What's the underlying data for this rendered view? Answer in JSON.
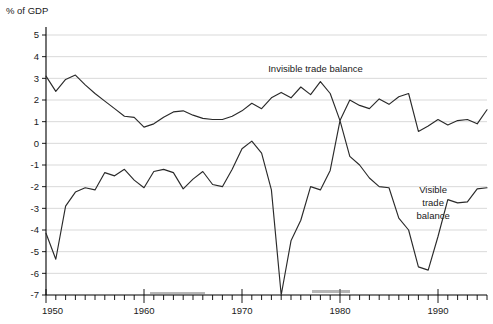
{
  "chart_data": {
    "type": "line",
    "title": "",
    "subtitle": "",
    "xlabel": "",
    "ylabel": "% of GDP",
    "ylim": [
      -7,
      5
    ],
    "xlim": [
      1950,
      1995
    ],
    "grid": true,
    "legend_position": "inline-annotations",
    "y_ticks": [
      "5",
      "4",
      "3",
      "2",
      "1",
      "0",
      "-1",
      "-2",
      "-3",
      "-4",
      "-5",
      "-6",
      "-7"
    ],
    "y_tick_values": [
      5,
      4,
      3,
      2,
      1,
      0,
      -1,
      -2,
      -3,
      -4,
      -5,
      -6,
      -7
    ],
    "x_ticks": [
      "1950",
      "1960",
      "1970",
      "1980",
      "1990"
    ],
    "x_tick_values": [
      1950,
      1960,
      1970,
      1980,
      1990
    ],
    "x_minor_interval": 1,
    "x": [
      1950,
      1951,
      1952,
      1953,
      1954,
      1955,
      1956,
      1957,
      1958,
      1959,
      1960,
      1961,
      1962,
      1963,
      1964,
      1965,
      1966,
      1967,
      1968,
      1969,
      1970,
      1971,
      1972,
      1973,
      1974,
      1975,
      1976,
      1977,
      1978,
      1979,
      1980,
      1981,
      1982,
      1983,
      1984,
      1985,
      1986,
      1987,
      1988,
      1989,
      1990,
      1991,
      1992,
      1993,
      1994,
      1995
    ],
    "series": [
      {
        "name": "Invisible trade balance",
        "color": "#2a2a2a",
        "values": [
          3.1,
          2.4,
          2.95,
          3.15,
          2.7,
          2.3,
          1.95,
          1.6,
          1.25,
          1.2,
          0.75,
          0.9,
          1.2,
          1.45,
          1.5,
          1.3,
          1.15,
          1.1,
          1.1,
          1.25,
          1.5,
          1.85,
          1.6,
          2.1,
          2.35,
          2.1,
          2.6,
          2.25,
          2.85,
          2.3,
          1.05,
          2.0,
          1.75,
          1.6,
          2.05,
          1.8,
          2.15,
          2.3,
          0.55,
          0.8,
          1.1,
          0.85,
          1.05,
          1.1,
          0.9,
          1.55
        ]
      },
      {
        "name": "Visible trade balance",
        "color": "#2a2a2a",
        "values": [
          -4.15,
          -5.35,
          -2.9,
          -2.25,
          -2.05,
          -2.15,
          -1.35,
          -1.5,
          -1.2,
          -1.7,
          -2.05,
          -1.3,
          -1.2,
          -1.35,
          -2.1,
          -1.65,
          -1.3,
          -1.9,
          -2.0,
          -1.2,
          -0.25,
          0.1,
          -0.45,
          -2.15,
          -7.0,
          -4.5,
          -3.55,
          -2.0,
          -2.15,
          -1.25,
          1.05,
          -0.6,
          -1.0,
          -1.6,
          -2.0,
          -2.05,
          -3.45,
          -4.0,
          -5.7,
          -5.85,
          -4.3,
          -2.6,
          -2.75,
          -2.7,
          -2.1,
          -2.05
        ]
      }
    ],
    "annotations": [
      {
        "name": "invisible-trade-balance-label",
        "text": "Invisible trade balance",
        "lines": [
          "Invisible trade balance"
        ],
        "x": 1977.5,
        "y": 3.3
      },
      {
        "name": "visible-trade-balance-label",
        "text": "Visible trade balance",
        "lines": [
          "Visible",
          "trade",
          "balance"
        ],
        "x": 1989.5,
        "y": -2.3
      }
    ]
  },
  "axes": {
    "y_axis_title": "% of GDP"
  }
}
